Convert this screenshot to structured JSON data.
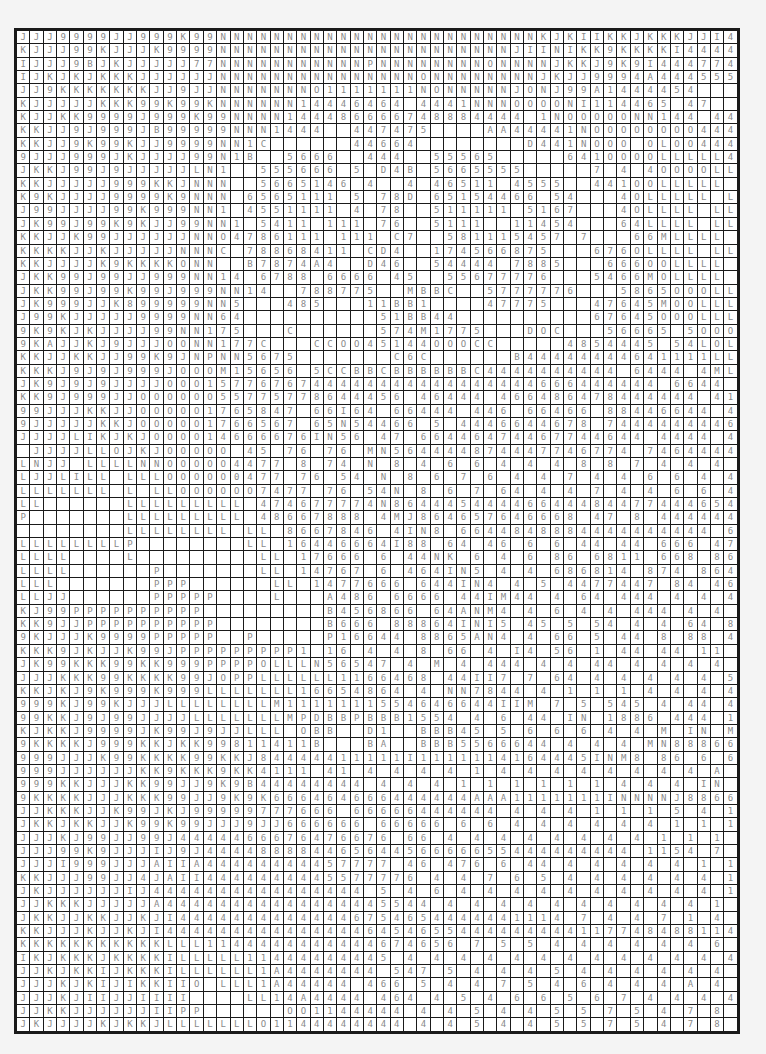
{
  "grid": {
    "columns": 54,
    "rows_count": 75,
    "text_color": "#8a8a8a",
    "cell_color": "#ffffff",
    "line_color": "#1a1a1a",
    "rows": [
      "JJJ9999JJ999K99NNNNNNNNNNNNNNNNNNNNNNNNKJKIIKKJKKKJJI4II4J9",
      "KJJJ99KJJJK9999NNNNNNNNNNNNNNNNNNNNNNJIINIKK9KKKKI444444",
      "IJJJ9BJKJJJJJ77NNNNNNNNNNNPNNNNNNNNONNNNJKKJ9K9I444774 4",
      "IJKJKJKKKJJJJJJNNNNNNNNNNNNNNNONNNNNNNNJKJJ9994A444555",
      "JJ9KKKKKKKJJ9JJNNNNNNNO1111111NONNNNNJONJ99A1444454",
      "KJJJJJKKK99K99KNNNNNN14446464 4441NNNOOOONI114465 47",
      "KJJKK9999J999K99NNNN144486666748884444 1NOOOOONN144 4455",
      "KKJJ9J999JB99999NNN1444  447475    AA44441NOOOOOOOO44444",
      "KKJJ9K99KJJ9999NN1C      44664        D441NOOO OLOO4444",
      "9JJJ999JKJJJJ99N1B  5666  444  55565     641OOOOLLLLL4444",
      "JKKJ99J9JJJJJLN1  555666 5 D4B 5665555     7 4 4OOOOLLLLLA444",
      "KKJJJJJ999KKJNNN  5665146 4  4 46511 4555  441OOLLLLL 444",
      "K9KJJJJ9999K9NNN 6565111 5 78D 65154466 54   4OLLLLL LL 444",
      "J99JJJJ99K999NN1 4551111 4 78  511111 5167   4OLLLL LLLA4",
      "JK99J99K9KJJ99NN1 5411 111 76  5111  11454   64LLLL LLL 44",
      "KKJJK99JJJJJJNNO4786111 111 C7  581115457 7   66MLLLL LLLA4",
      "KKKKJJKJJJJJNNNC 78868411 CD4  174566875   676OLLLL LL 44",
      "KKJJJJK9KKKKONN  B7874A4  D46  54444 7885   666OOLLLL LLL 44",
      "JKK99J99JJ999NN14 6788 6666 45  55677776   5466MOLLLL LL 44",
      "JKK99J99K99J999NN14  788775  MBBC  5777776   5865OOOLLLL 44",
      "JK999JJK899999NN5   485   11BB1    47775   47645MOOLLLLL 44",
      "J99KJJJJJ9999NN64          51BB44          67645OOOLLLL 454",
      "9K9KJKJJJJ99NN175   C      574M1775   DOC   56665 5OOOLLLLL 44",
      "9KAJJKJ9JJJOONN177C   CCOO45144OOOCC     4854445 54LOLLL 46",
      "KKJJKKJJ99K9JNPNN5675       C6C      B44444444641111LLL 466",
      "KKKJ9J9J999JOOOM15656 5CCBBCBBBBBBC4444444444 6444 4ML L6 46",
      "JK9J9J9JJJJOOO1577676744444444444444444666444444 6644 L645",
      "KK9J999JJOOOOOO55775778644456 46444 466486478444444 41 4876",
      "99JJJKKJJOOOOO1765847 66I64 66444 446 66466 88446644 4 4 465",
      "9JJJJJKKJOOOOO1766567 65N54466 5 4446644678 74444444464645 5",
      "JJJJLIKJKJOOOO14666676IN56 47 66446474467744644 4444 4445",
      " JJJJLLOJKJOOOOO 45 76 76 MN564444874447746774 74644444 44 5",
      "LNJJ LLLLNNOOOOO4477 8 74 N 8 4 6 6 4 4 4 8 8 7 4 4 4 7 7 6 7 7 7 4 7 7 6 4 4 4 4 4 4 5",
      "LJJLILL LLLOOOOO0477 76 54 N 8 6 7 6 4 4 7 4 4 6 6 4 4 4 6 7 4 4 6 6 7 5 8 4 7 4 4 4 4 5",
      "LLLLLLL L LLOOOOOO7477 76 54N 8 6 7 64 4 4 7 4 4 6 6 4 4 4 6 7 4 4 6 6 7 5 8 4 7 4 4 4 4 5",
      "LL      LLLLLLLLL 474677774N8644454444664448447744465444474 4",
      "P       LLLLLLLLL 48667888 4MJ864657646668 47 8 4444446446 444 744",
      "        LLLLLLLL LL 8667846 4IN8 6644848884444444444 66647 44",
      "LLLLLLLLP        LL 16446664I88 64 46 6 6 44 44 666 4784444 444 44",
      "LLLL    L         LL 17666 6 44NK 6 4 6 86 6811 668 86444 8 1446 446 674",
      "LLLL      P       LL 14767 6 464IN5 4 4 686814 874 8644 44 4 444 46666 467",
      "LLL       PPP      LL 1477666 644IN4 4 5 4477447 84 46 5466 6466 8666 67",
      "LLJJ      PPPPP    L   A486 6666 44IM44 4 64 444 4 4 4 6 666 6 4 8 78 648",
      "KJ99PPPPPPPPPP         B456866 64ANM4 4 6 4 4 444 4 4 6 4 4 88887 4 6667 44",
      "KK9JJPPPPPPPPPP        B666 88864INI5 45 5 54 4 4 64 8 46 48 7 8 44 44 66 7 6 5",
      "9KJJJK9999PPPPP  P     P16644 8865AN4 4 66 5 44 8 88 4 6 6 444 4 4 6 66 7 7 6",
      "KKK9JKJJK99JPPPPPPPPP1 16 4 4 8 66 4 I4 56 1 44 44 11 44 6666 6 6 6 8 4 48 7",
      "JK99KKK99KK999PPPPOLLLN56547 4 M 4 444 4 4 44 4 4 4 4 87 6 6 6 66 88 4 44",
      "JJJKKK99KKKK99JOPPLLLLLL1166468 44II7 7 64 4 4 4 4 4 5 4 4 866 6 6 64 44 6 6 4",
      "KKJKJ9K999K999LLLLLLL16654864 4 NN7844 4 1 1 1 4 4 4 4 888 8 6 6 6 47 4",
      "999KJ99KJJJLLLLLLLLM1111111554646644IIM 7 5 545 4 44 4 47 8 8 6 6 6 8 6 6 7",
      "99KKJ9J99JJJJLLLLLLLMPDBBPBBB1554 4 6 44 IN 1886 444 1 6 4 4 4 4 488866 7",
      "KJKKJ9999JK99J9JJLLL OBB  D1  BBB45 5 6 6 6 4 4 M IN M8 8 66 4 4 4 6 6 6 4 4 888",
      "9KKKKJ999KKJKK99811411B   BA  BBB5566644 4 4 4 MN88866 6 4 4 4 4 4 4 4 4 4 888",
      "999JJJK99KKKK99KKJ84444411111I1111114164445INM8 86 6 6 6 4 4 4 4 4 4 4 4 4 4",
      "999JJJJJJKK9KKK9KK4111 41 4 4 4 4 1 4 4 4 4 4 4 4 4 A I I I 8 8 7 6 6 6 4 4 4 1 4 4",
      "999KKJJJKK99JJ9K9B44444444 4 4 4 1 1 1 1 1 1 4 4 4 IN N 8 8 7 6 6 4 6 1 1 4 4",
      "9KKKKJJJKKK99JJ9K9K666464666444444AAA1111111INNNNJ88664444",
      "JJKKKJJK99JKJ99999777666 66666444444 4 4 4 1 1 1 5 4 1 6 I INN N 8 8 6 6 4 4 4 7",
      "JKKJKKJJK99K99JJJ9JJ666666 66666 6 6 4 4 4 4 4 4 1 1 1 4 4 7 4 1 MN N I 8 8 6 6 8",
      "JJJKJ99JJ99J4444466676476676 66 4 4 4 4 4 4 4 4 1 1 1 1 7 4 4 6 6 4 4 1 INM8 8 8 8",
      "JJJ99K9JJJIJ9J44448888446564456666655444444444 1154 7 7 4 4 4 1 1 NN N8 J",
      "JJJI999JJJAIIA44444444457777 46 476 6 44 4 4 4 4 4 1 1 7 4 46 7 1 4 1 1 1 M N N N",
      "KKJJJ99JJ4JAII4444444445577776 4 4 7 6 5 4 4 4 4 4 4 1 1 B 4 1 7 8 1 1 1 1 1 M I N",
      "JKJJJJJJIJ4444444444444444 5 4 6 4 4 4 4 4 4 4 4 4 4 1 1 6 4 8 1 1 4 4 1 1 M I",
      "JJKKKJJJJJA44444444444444445544 4 4 4 4 4 4 4 4 4 4 1 1 1 4 4 7 1 4 6 1 1 A 4",
      "JKKJJKKJJKJI44444444444446754654444441114 7 4 4 7 1 4 6 1 1 A 4",
      "KKJJJKJJKJI4444444444444446454655444444444117748488114",
      "KKKKKKKKKKKLLL1144444444444674656 7 5 5 4 4 4 4 4 4 6 4 1 1 1 8 4 4 4 1 8 1 4 4 4",
      "IKJKKKJKKKKILLLLL11444444445 4 4 4 4 4 4 4 4 4 4 4 4 4 4 4 4 1 1 4 8 4 4 4 A 4 4 4",
      "JJKJKKIJKKKILLLLLL1A4444444 547 5 4 4 4 5 4 4 4 4 4 4 4 4 4 A 1 4 7 1 7 4 4 4",
      "JJJKJKIJIKKIIO LLL1A44444 466 5 4 4 7 5 4 6 4 4 4 A 4 4 4 4 1 A 8 1 8 A 4 4 4",
      "JJJKJIIJJIIII    LL14A4444 464 4 5 4 6 6 5 6 7 4 4 4 4 A 4 4 4 4 4 A 1 4 A 4 4 4",
      "JJKKJJJJJJIIPP      OO1144444 4 4 5 4 4 5 5 7 5 4 7 8 7 4 4 A A 4 4 4 A 4 I I I 4",
      "JKJJJJKJKKJLLLLLLLO1144444444 4 4 5 4 4 5 5 7 5 4 7 8 7 4 4 A A 4 4 4 A 4 I I I 4"
    ]
  }
}
